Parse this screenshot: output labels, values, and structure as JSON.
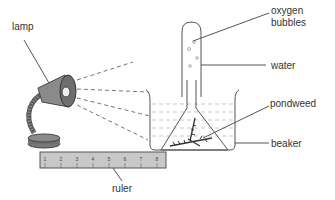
{
  "diagram": {
    "type": "photosynthesis-experiment-apparatus",
    "labels": {
      "lamp": "lamp",
      "oxygen_bubbles_line1": "oxygen",
      "oxygen_bubbles_line2": "bubbles",
      "water": "water",
      "pondweed": "pondweed",
      "beaker": "beaker",
      "ruler": "ruler"
    },
    "ruler_ticks": [
      "1",
      "2",
      "3",
      "4",
      "5",
      "6",
      "7",
      "8"
    ],
    "colors": {
      "line": "#555555",
      "lamp_fill": "#8a8a8a",
      "lamp_dark": "#6e6e6e",
      "ruler_fill": "#c8c8c8",
      "pondweed": "#3a3a3a",
      "water_dash": "#bbbbbb"
    }
  }
}
